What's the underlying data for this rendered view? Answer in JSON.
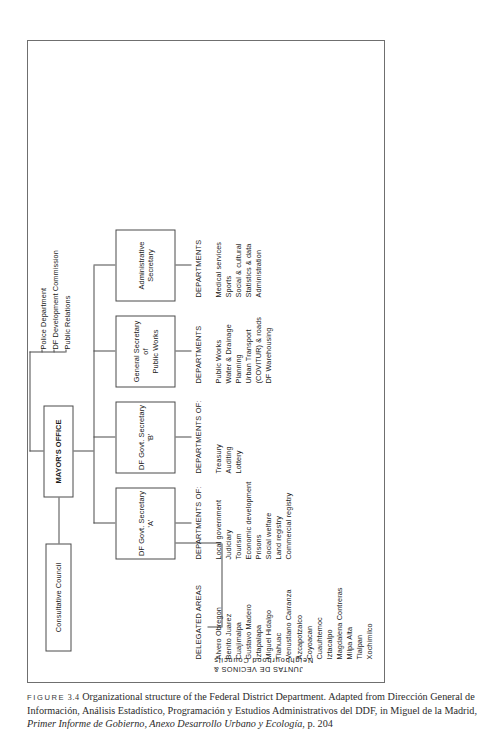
{
  "figure": {
    "label": "FIGURE",
    "number": "3.4",
    "caption_part1": "Organizational structure of the Federal District Department. Adapted from Dirección General de Información, Análisis Estadístico, Programación y Estudios Administrativos del DDF, in Miguel de la Madrid, ",
    "caption_italic": "Primer Informe de Gobierno, Anexo Desarrollo Urbano y Ecología",
    "caption_part2": ", p. 204"
  },
  "chart_data": {
    "type": "diagram",
    "title": "Organizational structure of the Federal District Department",
    "nodes": {
      "mayors_office": "MAYOR'S OFFICE",
      "consultative_council": "Consultative Council",
      "df_govt_secretary_a_l1": "DF Govt. Secretary",
      "df_govt_secretary_a_l2": "'A'",
      "df_govt_secretary_b_l1": "DF Govt. Secretary",
      "df_govt_secretary_b_l2": "'B'",
      "public_works_l1": "General Secretary",
      "public_works_l2": "of",
      "public_works_l3": "Public Works",
      "administrative_secretary_l1": "Administrative",
      "administrative_secretary_l2": "Secretary"
    },
    "direct_reports": [
      "Police Department",
      "DF Development Commission",
      "Public Relations"
    ],
    "columns": [
      {
        "heading": "DELEGATED AREAS",
        "side_label_line1": "Neighbourhood Councils",
        "side_label_line2": "JUNTAS DE VECINOS &",
        "items": [
          "Alvero Obregon",
          "Benito Juarez",
          "Cuajimalpa",
          "Gustavo Madero",
          "Iztapalapa",
          "Miguel Hidalgo",
          "Tlahuac",
          "Venustiano Carranza",
          "Azcapotzalco",
          "Coyoacan",
          "Cuauhtemoc",
          "Iztacalpo",
          "Magdalena Contreras",
          "Milpa Alta",
          "Tlalpan",
          "Xochimilco"
        ]
      },
      {
        "heading": "DEPARTMENTS OF:",
        "items": [
          "Local government",
          "Judiciary",
          "Tourism",
          "Economic development",
          "Prisons",
          "Social welfare",
          "Land registry",
          "Commercial registry"
        ]
      },
      {
        "heading": "DEPARTMENTS OF:",
        "items": [
          "Treasury",
          "Auditing",
          "Lottery"
        ]
      },
      {
        "heading": "DEPARTMENTS",
        "items": [
          "Public Works",
          "Water & Drainage",
          "Planning",
          "Urban Transport",
          "(COVITUR) & roads",
          "DF Warehousing"
        ]
      },
      {
        "heading": "DEPARTMENTS",
        "items": [
          "Medical services",
          "Sports",
          "Social & cultural",
          "Statistics & data",
          "Administration"
        ]
      }
    ]
  }
}
